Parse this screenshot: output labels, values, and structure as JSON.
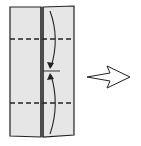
{
  "diagram": {
    "type": "origami-fold-step",
    "colors": {
      "paper_fill": "#e6e6e6",
      "outline": "#222222",
      "arrow_fill": "#ffffff"
    },
    "paper": {
      "left_panel": "folded-left-half",
      "right_panel": "folded-right-half",
      "center_fold": "vertical-crease"
    },
    "fold_lines": [
      {
        "style": "dashed",
        "position": "upper-third",
        "label": "valley-fold"
      },
      {
        "style": "dashed",
        "position": "lower-third",
        "label": "valley-fold"
      }
    ],
    "fold_arrows": [
      {
        "direction": "down",
        "from": "top-edge",
        "to": "center-mark"
      },
      {
        "direction": "up",
        "from": "bottom-edge",
        "to": "center-mark"
      }
    ],
    "next_step_arrow": {
      "direction": "right"
    }
  }
}
